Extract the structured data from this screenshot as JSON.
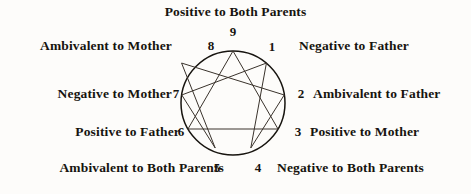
{
  "figure": {
    "title": "Positive to Both Parents",
    "diagram_type": "enneagram",
    "geometry": {
      "center_x": 233,
      "center_y": 103,
      "radius": 52
    },
    "points": [
      {
        "number": "9",
        "label": "Positive to Both Parents",
        "side": "top",
        "angle_deg": 90
      },
      {
        "number": "1",
        "label": "Negative to Father",
        "side": "right",
        "angle_deg": 50
      },
      {
        "number": "2",
        "label": "Ambivalent to Father",
        "side": "right",
        "angle_deg": 10
      },
      {
        "number": "3",
        "label": "Positive to Mother",
        "side": "right",
        "angle_deg": -30
      },
      {
        "number": "4",
        "label": "Negative to Both Parents",
        "side": "bottom",
        "angle_deg": -70
      },
      {
        "number": "5",
        "label": "Ambivalent to Both Parents",
        "side": "bottom",
        "angle_deg": -110
      },
      {
        "number": "6",
        "label": "Positive to Father",
        "side": "left",
        "angle_deg": -150
      },
      {
        "number": "7",
        "label": "Negative to Mother",
        "side": "left",
        "angle_deg": 170
      },
      {
        "number": "8",
        "label": "Ambivalent to Mother",
        "side": "left",
        "angle_deg": 130
      }
    ],
    "inner_figures": {
      "triangle": [
        "9",
        "3",
        "6"
      ],
      "hexad": [
        "1",
        "4",
        "2",
        "8",
        "5",
        "7"
      ]
    },
    "colors": {
      "background": "#fdfcfa",
      "ink": "#17140f",
      "line": "#3a332c"
    }
  }
}
